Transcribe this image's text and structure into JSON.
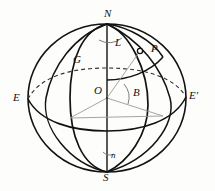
{
  "figure": {
    "name": "terrestrial-sphere-coordinates-diagram",
    "type": "geometry-diagram",
    "background_color": "#fdfdfc",
    "stroke_color": "#121212",
    "thin_stroke_color": "#8d8d8d",
    "width": 215,
    "height": 191
  },
  "labels": {
    "north_pole": "N",
    "south_pole": "S",
    "center": "O",
    "east_left": "E",
    "east_right": "E'",
    "greenwich_meridian": "G",
    "point": "P",
    "longitude_angle": "L",
    "latitude_angle": "B",
    "foot_angle": "n"
  },
  "label_positions": {
    "north_pole": {
      "x": 104,
      "y": 9
    },
    "south_pole": {
      "x": 104,
      "y": 174
    },
    "center": {
      "x": 95,
      "y": 88
    },
    "east_left": {
      "x": 14,
      "y": 95
    },
    "east_right": {
      "x": 190,
      "y": 93
    },
    "greenwich_meridian": {
      "x": 73,
      "y": 58
    },
    "point": {
      "x": 150,
      "y": 46
    },
    "longitude_angle": {
      "x": 115,
      "y": 40
    },
    "latitude_angle": {
      "x": 134,
      "y": 90
    },
    "foot_angle": {
      "x": 111,
      "y": 154
    }
  },
  "geometry": {
    "outline_ellipse": {
      "cx": 107,
      "cy": 98,
      "rx": 79,
      "ry": 74
    },
    "equator_ellipse": {
      "cx": 107,
      "cy": 98,
      "rx": 79,
      "ry": 24
    },
    "polar_axis": {
      "x": 107,
      "y_top": 24,
      "y_bottom": 172
    },
    "point_marker": {
      "cx": 140,
      "cy": 51,
      "r": 2.4
    },
    "meridian_greenwich_label_anchor": {
      "x": 86,
      "y": 62
    },
    "angle_arc_L_radius": 22,
    "angle_arc_B_radius": 17,
    "angle_arc_n_radius": 13
  },
  "series_of_curves": [
    {
      "name": "sphere-outline",
      "style": "solid"
    },
    {
      "name": "equator-front",
      "style": "solid"
    },
    {
      "name": "equator-back",
      "style": "dashed"
    },
    {
      "name": "meridian-greenwich",
      "style": "solid"
    },
    {
      "name": "meridian-through-p",
      "style": "solid"
    },
    {
      "name": "parallel-of-latitude-through-p",
      "style": "solid"
    },
    {
      "name": "radius-lines",
      "style": "thin-solid"
    }
  ]
}
